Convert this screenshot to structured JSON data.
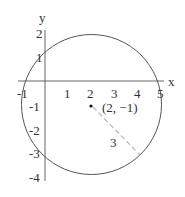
{
  "diagram": {
    "type": "circle-on-coordinate-plane",
    "axes": {
      "x_label": "x",
      "y_label": "y",
      "x_ticks": [
        "-1",
        "1",
        "2",
        "3",
        "4",
        "5"
      ],
      "y_ticks": [
        "2",
        "1",
        "-1",
        "-2",
        "-3",
        "-4"
      ]
    },
    "circle": {
      "center": [
        2,
        -1
      ],
      "radius": 3
    },
    "center_label": "(2, −1)",
    "radius_label": "3",
    "colors": {
      "stroke": "#555555",
      "radius_dash": "#bbbbbb",
      "text": "#333333"
    }
  }
}
